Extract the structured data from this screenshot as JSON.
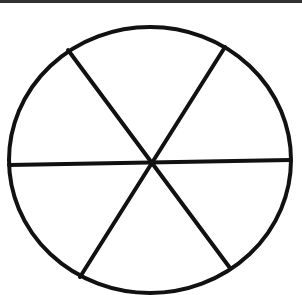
{
  "diagram": {
    "title": "",
    "stroke_color": "#111111",
    "background_color": "#ffffff",
    "border_color": "#333333",
    "circle": {
      "cx": 150,
      "cy": 160,
      "rx": 141,
      "ry": 133
    },
    "sectors": 6,
    "lines": [
      {
        "name": "horizontal",
        "x1": 9,
        "y1": 165,
        "x2": 290,
        "y2": 160
      },
      {
        "name": "diagonal-a",
        "x1": 68,
        "y1": 50,
        "x2": 230,
        "y2": 268
      },
      {
        "name": "diagonal-b",
        "x1": 225,
        "y1": 47,
        "x2": 80,
        "y2": 277
      }
    ]
  }
}
